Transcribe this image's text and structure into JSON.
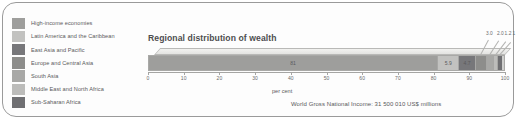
{
  "legend": {
    "items": [
      {
        "label": "High-income economies",
        "color": "#9e9e9c"
      },
      {
        "label": "Latin America and the Caribbean",
        "color": "#c2c2c0"
      },
      {
        "label": "East Asia and Pacific",
        "color": "#77777a"
      },
      {
        "label": "Europe and Central Asia",
        "color": "#8d8d8b"
      },
      {
        "label": "South Asia",
        "color": "#a8a8a6"
      },
      {
        "label": "Middle East and North Africa",
        "color": "#bcbcba"
      },
      {
        "label": "Sub-Saharan Africa",
        "color": "#6f6f72"
      }
    ]
  },
  "chart_data": {
    "type": "bar",
    "title": "Regional distribution of wealth",
    "xlabel": "per cent",
    "ylabel": "",
    "xlim": [
      0,
      100
    ],
    "grid": false,
    "legend_position": "left",
    "orientation": "horizontal-stacked",
    "categories": [
      "High-income economies",
      "Latin America and the Caribbean",
      "East Asia and Pacific",
      "Europe and Central Asia",
      "South Asia",
      "Middle East and North Africa",
      "Sub-Saharan Africa"
    ],
    "values": [
      81,
      5.9,
      4.7,
      3.0,
      2.0,
      1.2,
      1
    ],
    "inside_labels": [
      "81",
      "5.9",
      "4.7",
      "",
      "",
      "",
      ""
    ],
    "callout_labels": [
      "3.0",
      "2.0",
      "1.2",
      "1"
    ],
    "tick_labels": [
      "0",
      "10",
      "20",
      "30",
      "40",
      "50",
      "60",
      "70",
      "80",
      "90",
      "100"
    ],
    "caption": "World Gross National Income: 31 500 010 US$ millions"
  }
}
